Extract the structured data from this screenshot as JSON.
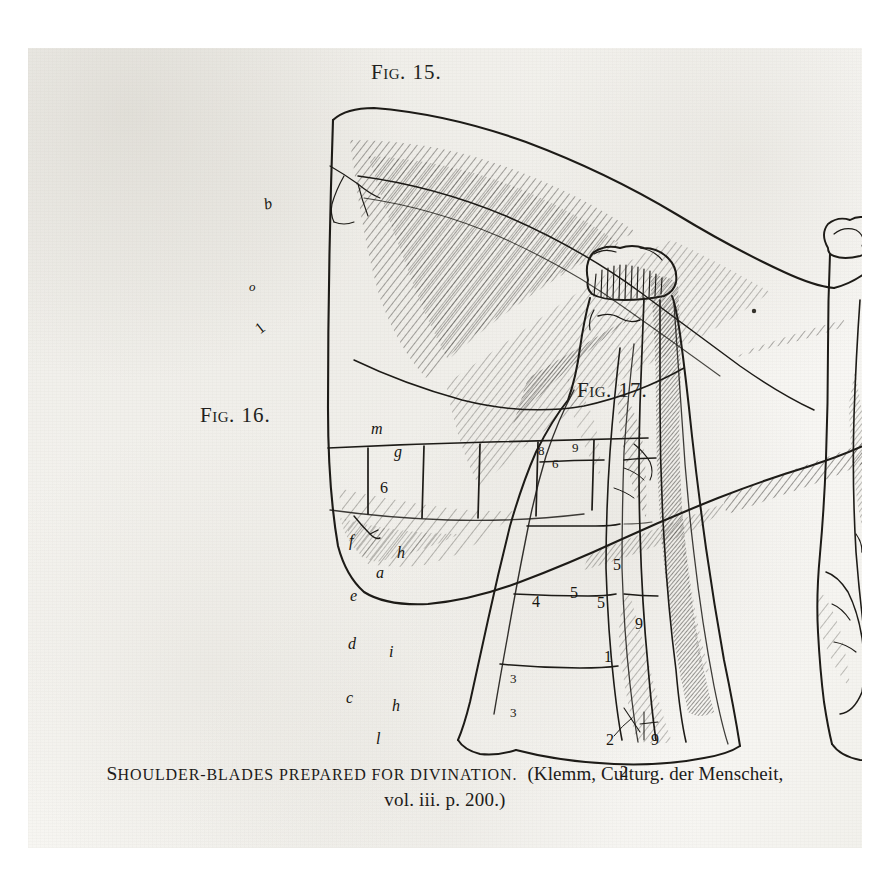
{
  "page": {
    "background_color": "#ffffff",
    "paper_color": "#f5f4f0",
    "ink_color": "#1d1b19"
  },
  "figures": [
    {
      "id": "fig15",
      "label_prefix": "F",
      "label_small": "IG",
      "label_number": ". 15.",
      "label_full": "FIG. 15.",
      "description": "Shoulder-blade (scapula) shown horizontally, blade to the left, articular head to the right, with hatched shading, a ruled row of divination cells and reference marks.",
      "markers": [
        {
          "text": "b",
          "style": "italic"
        },
        {
          "text": "o",
          "style": "italic"
        },
        {
          "text": "1",
          "style": "number"
        }
      ]
    },
    {
      "id": "fig16",
      "label_prefix": "F",
      "label_small": "IG",
      "label_number": ". 16.",
      "label_full": "FIG. 16.",
      "description": "Shoulder-blade standing upright, viewed from the flat side, ruled across with horizontal division lines lettered for divination.",
      "markers": [
        {
          "text": "m",
          "style": "italic"
        },
        {
          "text": "g",
          "style": "italic"
        },
        {
          "text": "6",
          "style": "number"
        },
        {
          "text": "f",
          "style": "italic"
        },
        {
          "text": "h",
          "style": "italic"
        },
        {
          "text": "a",
          "style": "italic"
        },
        {
          "text": "e",
          "style": "italic"
        },
        {
          "text": "d",
          "style": "italic"
        },
        {
          "text": "i",
          "style": "italic"
        },
        {
          "text": "c",
          "style": "italic"
        },
        {
          "text": "h",
          "style": "italic"
        },
        {
          "text": "l",
          "style": "italic"
        }
      ]
    },
    {
      "id": "fig17",
      "label_prefix": "F",
      "label_small": "IG",
      "label_number": ". 17.",
      "label_full": "FIG. 17.",
      "description": "Shoulder-blade standing upright, viewed from the ridged side, heavily hatched, the surface covered with numbered heat cracks used in scapulimancy.",
      "markers": [
        {
          "text": "8",
          "style": "number"
        },
        {
          "text": "9",
          "style": "number"
        },
        {
          "text": "6",
          "style": "number"
        },
        {
          "text": "5",
          "style": "number"
        },
        {
          "text": "5",
          "style": "number"
        },
        {
          "text": "5",
          "style": "number"
        },
        {
          "text": "4",
          "style": "number"
        },
        {
          "text": "9",
          "style": "number"
        },
        {
          "text": "1",
          "style": "number"
        },
        {
          "text": "3",
          "style": "number"
        },
        {
          "text": "3",
          "style": "number"
        },
        {
          "text": "2",
          "style": "number"
        },
        {
          "text": "2",
          "style": "number"
        },
        {
          "text": "9",
          "style": "number"
        }
      ]
    }
  ],
  "caption": {
    "title_initial": "S",
    "title_rest": "HOULDER-BLADES PREPARED FOR DIVINATION.",
    "title_plain": "SHOULDER-BLADES PREPARED FOR DIVINATION.",
    "source_line1": "(Klemm, Culturg. der Menscheit,",
    "source_line2": "vol. iii. p. 200.)"
  }
}
